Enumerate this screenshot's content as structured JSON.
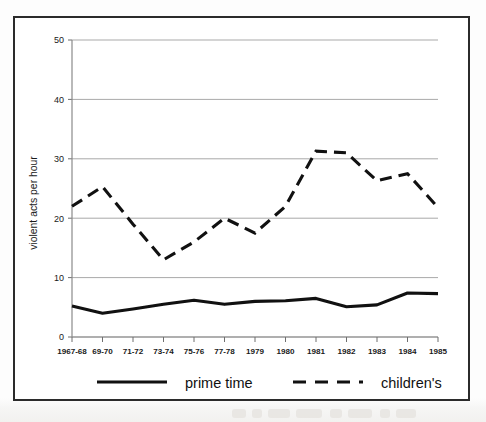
{
  "chart_data": {
    "type": "line",
    "title": "",
    "xlabel": "",
    "ylabel": "violent acts per hour",
    "ylim": [
      0,
      50
    ],
    "yticks": [
      0,
      10,
      20,
      30,
      40,
      50
    ],
    "grid": true,
    "legend_position": "bottom",
    "categories": [
      "1967-68",
      "69-70",
      "71-72",
      "73-74",
      "75-76",
      "77-78",
      "1979",
      "1980",
      "1981",
      "1982",
      "1983",
      "1984",
      "1985"
    ],
    "series": [
      {
        "name": "prime time",
        "style": "solid",
        "color": "#111111",
        "values": [
          5.2,
          4.0,
          4.7,
          5.5,
          6.2,
          5.5,
          6.0,
          6.1,
          6.5,
          5.1,
          5.4,
          7.4,
          7.3
        ]
      },
      {
        "name": "children's",
        "style": "dashed",
        "color": "#111111",
        "values": [
          22.0,
          25.3,
          19.0,
          13.0,
          16.0,
          20.0,
          17.5,
          22.0,
          31.3,
          31.0,
          26.3,
          27.5,
          21.8
        ]
      }
    ]
  },
  "legend": {
    "items": [
      {
        "label": "prime time",
        "style": "solid"
      },
      {
        "label": "children's",
        "style": "dashed"
      }
    ]
  },
  "colors": {
    "frame": "#2b2b2b",
    "grid": "#a9a9a9",
    "ink": "#111111",
    "background": "#ffffff"
  }
}
